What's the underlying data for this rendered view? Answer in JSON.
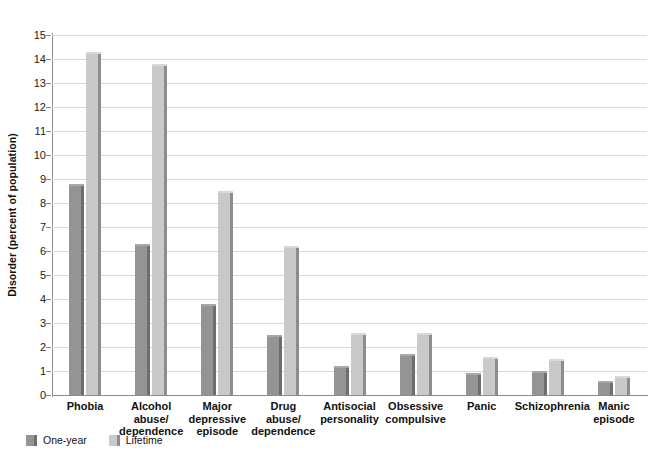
{
  "chart_data": {
    "type": "bar",
    "title": "",
    "xlabel": "",
    "ylabel": "Disorder (percent of population)",
    "ylim": [
      0,
      15
    ],
    "ytick_step": 1,
    "grid": true,
    "legend_position": "bottom-left",
    "categories": [
      "Phobia",
      "Alcohol abuse/ dependence",
      "Major depressive episode",
      "Drug abuse/ dependence",
      "Antisocial personality",
      "Obsessive compulsive",
      "Panic",
      "Schizophrenia",
      "Manic episode"
    ],
    "category_lines": [
      [
        "Phobia"
      ],
      [
        "Alcohol",
        "abuse/",
        "dependence"
      ],
      [
        "Major",
        "depressive",
        "episode"
      ],
      [
        "Drug",
        "abuse/",
        "dependence"
      ],
      [
        "Antisocial",
        "personality"
      ],
      [
        "Obsessive",
        "compulsive"
      ],
      [
        "Panic"
      ],
      [
        "Schizophrenia"
      ],
      [
        "Manic",
        "episode"
      ]
    ],
    "series": [
      {
        "name": "One-year",
        "color": "#949494",
        "values": [
          8.8,
          6.3,
          3.8,
          2.5,
          1.2,
          1.7,
          0.9,
          1.0,
          0.6
        ]
      },
      {
        "name": "Lifetime",
        "color": "#c9c9c9",
        "values": [
          14.3,
          13.8,
          8.5,
          6.2,
          2.6,
          2.6,
          1.6,
          1.5,
          0.8
        ]
      }
    ],
    "ytick_labels": [
      "0",
      "1",
      "2",
      "3",
      "4",
      "5",
      "6",
      "7",
      "8",
      "9",
      "10",
      "11",
      "12",
      "13",
      "14",
      "15"
    ]
  },
  "legend": {
    "items": [
      {
        "label": "One-year",
        "color": "#949494"
      },
      {
        "label": "Lifetime",
        "color": "#c9c9c9"
      }
    ]
  }
}
